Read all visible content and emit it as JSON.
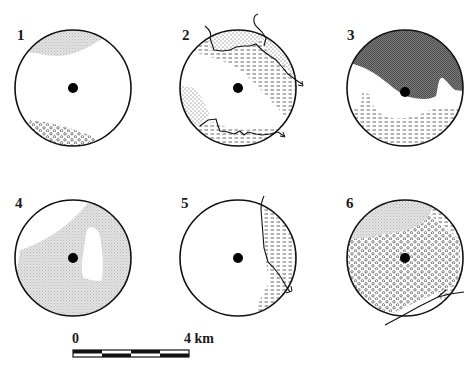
{
  "figure": {
    "panels": [
      {
        "id": "1",
        "label": "1",
        "zones": [
          "light-grey-stipple (north)",
          "open-circles (south)"
        ],
        "rivers": 0
      },
      {
        "id": "2",
        "label": "2",
        "zones": [
          "fine-dot-stipple",
          "dashed-hatch"
        ],
        "rivers": 3
      },
      {
        "id": "3",
        "label": "3",
        "zones": [
          "dark-grey (north)",
          "dashed-hatch (south)"
        ],
        "rivers": 0
      },
      {
        "id": "4",
        "label": "4",
        "zones": [
          "light-grey-stipple (most of circle)"
        ],
        "rivers": 0
      },
      {
        "id": "5",
        "label": "5",
        "zones": [
          "dashed-hatch (east)"
        ],
        "rivers": 1
      },
      {
        "id": "6",
        "label": "6",
        "zones": [
          "light-grey-stipple (north)",
          "dashed-hatch (east)",
          "open-circles (centre/south-west)"
        ],
        "rivers": 1
      }
    ],
    "scale_bar": {
      "start_label": "0",
      "end_label": "4 km",
      "segments": 4
    },
    "caption": "",
    "colors": {
      "ink": "#111111",
      "light_stipple": "#d6d6d6",
      "dark_fill": "#6e6e6e",
      "paper": "#ffffff"
    }
  }
}
